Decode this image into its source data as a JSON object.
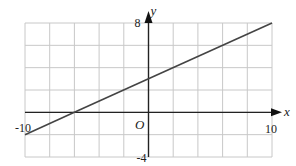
{
  "chart_data": {
    "type": "line",
    "title": "",
    "xlabel": "x",
    "ylabel": "y",
    "origin_label": "O",
    "xlim": [
      -10,
      10
    ],
    "ylim": [
      -4,
      8
    ],
    "grid": true,
    "grid_step_x": 2,
    "grid_step_y": 2,
    "tick_labels": {
      "x_min": "-10",
      "x_max": "10",
      "y_max": "8",
      "y_min": "-4"
    },
    "series": [
      {
        "name": "line",
        "equation": "y = 0.5x + 3",
        "x": [
          -10,
          -6,
          0,
          10
        ],
        "y": [
          -2,
          0,
          3,
          8
        ]
      }
    ],
    "legend": null
  },
  "colors": {
    "grid": "#c8c8c8",
    "axis": "#222222",
    "line": "#444444"
  }
}
